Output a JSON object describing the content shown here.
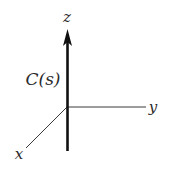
{
  "diagram": {
    "title": "",
    "axes": {
      "z": {
        "label": "z"
      },
      "y": {
        "label": "y"
      },
      "x": {
        "label": "x"
      }
    },
    "curve": {
      "label": "C(s)",
      "direction": "along +z axis"
    },
    "colors": {
      "axis": "#3a3a3a",
      "curve": "#111111",
      "text": "#2a2a2a"
    }
  }
}
